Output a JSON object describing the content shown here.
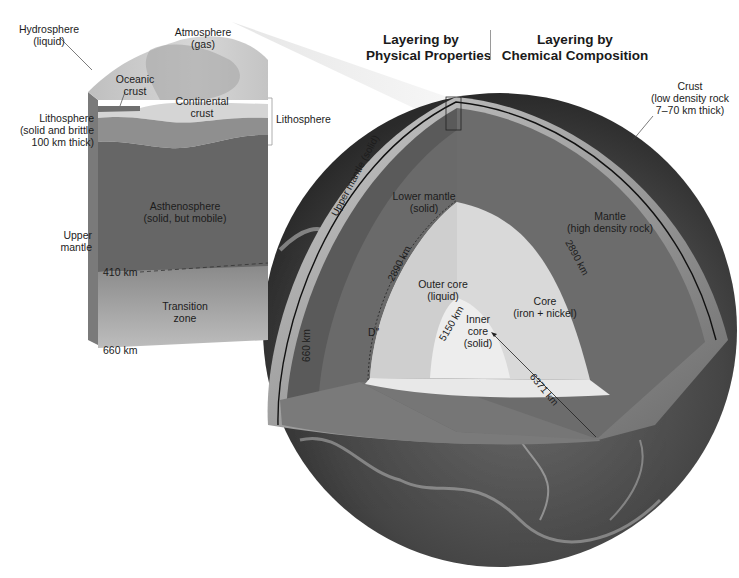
{
  "headers": {
    "physical": {
      "line1": "Layering by",
      "line2": "Physical Properties"
    },
    "chemical": {
      "line1": "Layering by",
      "line2": "Chemical Composition"
    }
  },
  "block": {
    "hydrosphere": {
      "line1": "Hydrosphere",
      "line2": "(liquid)"
    },
    "atmosphere": {
      "line1": "Atmosphere",
      "line2": "(gas)"
    },
    "oceanic_crust": {
      "line1": "Oceanic",
      "line2": "crust"
    },
    "continental_crust": {
      "line1": "Continental",
      "line2": "crust"
    },
    "lithosphere_left": {
      "line1": "Lithosphere",
      "line2": "(solid and brittle",
      "line3": "100 km thick)"
    },
    "lithosphere_bracket": "Lithosphere",
    "asthenosphere": {
      "line1": "Asthenosphere",
      "line2": "(solid, but mobile)"
    },
    "upper_mantle": {
      "line1": "Upper",
      "line2": "mantle"
    },
    "depth_410": "410 km",
    "transition_zone": {
      "line1": "Transition",
      "line2": "zone"
    },
    "depth_660": "660 km"
  },
  "globe": {
    "crust": {
      "line1": "Crust",
      "line2": "(low density rock",
      "line3": "7–70 km thick)"
    },
    "upper_mantle_solid": "Upper mantle (solid)",
    "lower_mantle": {
      "line1": "Lower mantle",
      "line2": "(solid)"
    },
    "mantle": {
      "line1": "Mantle",
      "line2": "(high density rock)"
    },
    "depth_2890_left": "2890 km",
    "depth_2890_right": "2890 km",
    "outer_core": {
      "line1": "Outer core",
      "line2": "(liquid)"
    },
    "core": {
      "line1": "Core",
      "line2": "(iron + nickel)"
    },
    "depth_5150": "5150 km",
    "inner_core": {
      "line1": "Inner",
      "line2": "core",
      "line3": "(solid)"
    },
    "d_double_prime": "D\"",
    "depth_660": "660 km",
    "radius": "6371 km"
  },
  "colors": {
    "ocean_surface": "#5a5a5a",
    "crust_shell": "#a8a8a8",
    "upper_mantle": "#5e5e5e",
    "lower_mantle": "#707070",
    "outer_core": "#d6d6d6",
    "inner_core": "#ececec",
    "lithosphere": "#8c8c8c",
    "asthenosphere": "#6a6a6a",
    "transition": "#a0a0a0"
  }
}
